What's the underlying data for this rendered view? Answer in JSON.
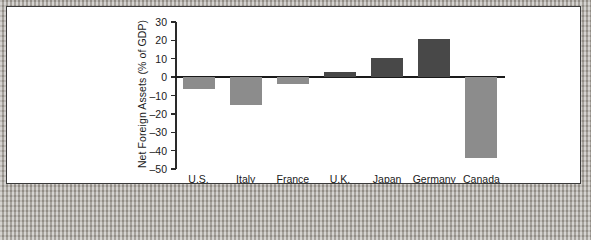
{
  "figure": {
    "background_color": "#ffffff",
    "frame_color": "#3a3a3a",
    "margin_color": "#aaa69f"
  },
  "chart_data": {
    "type": "bar",
    "title": "",
    "subtitle": "",
    "xlabel": "",
    "ylabel": "Net Foreign Assets (% of GDP)",
    "categories": [
      "U.S.",
      "Italy",
      "France",
      "U.K.",
      "Japan",
      "Germany",
      "Canada"
    ],
    "values": [
      -6.5,
      -15,
      -4,
      3,
      10.5,
      21,
      -44
    ],
    "ylim": [
      -50,
      30
    ],
    "yticks": [
      30,
      20,
      10,
      0,
      -10,
      -20,
      -30,
      -40,
      -50
    ],
    "ytick_labels": [
      "30",
      "20",
      "10",
      "0",
      "–10",
      "–20",
      "–30",
      "–40",
      "–50"
    ],
    "grid": false,
    "legend": false,
    "legend_position": "none",
    "zero_line": true,
    "colors": {
      "positive_bar": "#484848",
      "negative_bar": "#8c8c8c",
      "axis": "#2a2a2a",
      "zero_line": "#1a1a1a",
      "text": "#1a1a1a"
    }
  }
}
